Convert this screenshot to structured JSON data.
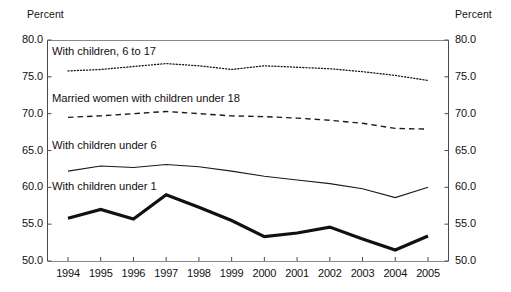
{
  "chart_data": {
    "type": "line",
    "title": "",
    "xlabel": "",
    "ylabel": "Percent",
    "ylabel_right": "Percent",
    "grid": false,
    "legend_position": "inline-labels",
    "ylim": [
      50.0,
      80.0
    ],
    "yticks": [
      "50.0",
      "55.0",
      "60.0",
      "65.0",
      "70.0",
      "75.0",
      "80.0"
    ],
    "ytick_values": [
      50.0,
      55.0,
      60.0,
      65.0,
      70.0,
      75.0,
      80.0
    ],
    "categories": [
      "1994",
      "1995",
      "1996",
      "1997",
      "1998",
      "1999",
      "2000",
      "2001",
      "2002",
      "2003",
      "2004",
      "2005"
    ],
    "x": [
      1994,
      1995,
      1996,
      1997,
      1998,
      1999,
      2000,
      2001,
      2002,
      2003,
      2004,
      2005
    ],
    "series": [
      {
        "name": "With children, 6 to 17",
        "style": "dotted",
        "color": "#1a1a1a",
        "values": [
          75.8,
          76.0,
          76.4,
          76.8,
          76.5,
          76.0,
          76.5,
          76.3,
          76.1,
          75.7,
          75.2,
          74.5
        ]
      },
      {
        "name": "Married women with children under 18",
        "style": "dashed",
        "color": "#1a1a1a",
        "values": [
          69.5,
          69.7,
          70.0,
          70.3,
          70.0,
          69.7,
          69.6,
          69.4,
          69.1,
          68.7,
          68.0,
          67.9
        ]
      },
      {
        "name": "With children under 6",
        "style": "solid-thin",
        "color": "#1a1a1a",
        "values": [
          62.2,
          62.9,
          62.7,
          63.1,
          62.8,
          62.2,
          61.5,
          61.0,
          60.5,
          59.8,
          58.6,
          60.0
        ]
      },
      {
        "name": "With children under 1",
        "style": "solid-thick",
        "color": "#111111",
        "values": [
          55.8,
          57.0,
          55.7,
          59.0,
          57.3,
          55.5,
          53.3,
          53.8,
          54.6,
          53.0,
          51.5,
          53.4
        ]
      }
    ]
  },
  "labels": {
    "axis_title_left": "Percent",
    "axis_title_right": "Percent",
    "series_0": "With children, 6 to 17",
    "series_1": "Married women with children under 18",
    "series_2": "With children under 6",
    "series_3": "With children under 1"
  }
}
